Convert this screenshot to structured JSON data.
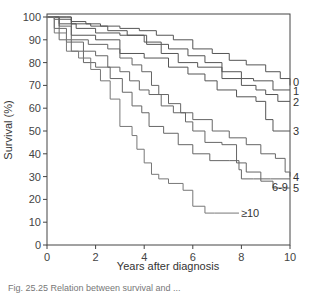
{
  "chart_data": {
    "type": "line",
    "subtype": "kaplan-meier-step",
    "title": "",
    "xlabel": "Years after diagnosis",
    "ylabel": "Survival (%)",
    "xlim": [
      0,
      10
    ],
    "ylim": [
      0,
      100
    ],
    "xticks": [
      0,
      2,
      4,
      6,
      8,
      10
    ],
    "yticks": [
      0,
      10,
      20,
      30,
      40,
      50,
      60,
      70,
      80,
      90,
      100
    ],
    "grid": false,
    "legend": "inline labels at right end of curves",
    "series": [
      {
        "name": "0",
        "label": "0",
        "points": [
          [
            0,
            100
          ],
          [
            0.8,
            100
          ],
          [
            1.0,
            98
          ],
          [
            1.6,
            97
          ],
          [
            2.2,
            96
          ],
          [
            3.0,
            95
          ],
          [
            3.8,
            94
          ],
          [
            4.5,
            92
          ],
          [
            5.2,
            90
          ],
          [
            6.0,
            86
          ],
          [
            6.8,
            84
          ],
          [
            7.5,
            81
          ],
          [
            8.2,
            79
          ],
          [
            9.0,
            76
          ],
          [
            9.6,
            73
          ],
          [
            10,
            70
          ]
        ]
      },
      {
        "name": "1",
        "label": "1",
        "points": [
          [
            0,
            100
          ],
          [
            0.3,
            99
          ],
          [
            1.0,
            97
          ],
          [
            1.8,
            96
          ],
          [
            2.5,
            94
          ],
          [
            3.3,
            92
          ],
          [
            4.1,
            88
          ],
          [
            5.0,
            86
          ],
          [
            5.8,
            83
          ],
          [
            6.5,
            80
          ],
          [
            7.2,
            76
          ],
          [
            8.0,
            73
          ],
          [
            8.5,
            72
          ],
          [
            9.3,
            68
          ],
          [
            10,
            68
          ]
        ]
      },
      {
        "name": "2",
        "label": "2",
        "points": [
          [
            0,
            100
          ],
          [
            0.5,
            97
          ],
          [
            1.2,
            95
          ],
          [
            2.0,
            93
          ],
          [
            3.0,
            92
          ],
          [
            4.0,
            89
          ],
          [
            4.7,
            84
          ],
          [
            5.4,
            80
          ],
          [
            6.2,
            78
          ],
          [
            7.2,
            73
          ],
          [
            8.0,
            70
          ],
          [
            8.6,
            68
          ],
          [
            9.0,
            66
          ],
          [
            9.5,
            63
          ],
          [
            10,
            63
          ]
        ]
      },
      {
        "name": "3",
        "label": "3",
        "points": [
          [
            0,
            100
          ],
          [
            1.0,
            92
          ],
          [
            2.0,
            90
          ],
          [
            3.0,
            84
          ],
          [
            4.0,
            82
          ],
          [
            5.0,
            78
          ],
          [
            5.8,
            75
          ],
          [
            6.5,
            72
          ],
          [
            7.0,
            68
          ],
          [
            7.8,
            65
          ],
          [
            8.6,
            63
          ],
          [
            9.0,
            55
          ],
          [
            9.3,
            50
          ],
          [
            10,
            50
          ]
        ]
      },
      {
        "name": "4",
        "label": "4",
        "points": [
          [
            0,
            100
          ],
          [
            0.5,
            96
          ],
          [
            1.0,
            90
          ],
          [
            1.7,
            88
          ],
          [
            2.5,
            86
          ],
          [
            3.0,
            82
          ],
          [
            3.5,
            79
          ],
          [
            3.9,
            76
          ],
          [
            4.3,
            70
          ],
          [
            4.6,
            66
          ],
          [
            5.0,
            62
          ],
          [
            5.5,
            58
          ],
          [
            6.0,
            55
          ],
          [
            6.8,
            50
          ],
          [
            7.5,
            47
          ],
          [
            8.2,
            44
          ],
          [
            8.8,
            40
          ],
          [
            9.4,
            38
          ],
          [
            9.8,
            32
          ],
          [
            10,
            30
          ]
        ]
      },
      {
        "name": "5",
        "label": "5",
        "points": [
          [
            0,
            100
          ],
          [
            0.3,
            95
          ],
          [
            0.8,
            89
          ],
          [
            1.5,
            85
          ],
          [
            2.0,
            83
          ],
          [
            2.5,
            78
          ],
          [
            3.0,
            76
          ],
          [
            3.4,
            72
          ],
          [
            3.8,
            68
          ],
          [
            4.2,
            66
          ],
          [
            4.7,
            61
          ],
          [
            5.2,
            58
          ],
          [
            5.7,
            54
          ],
          [
            6.0,
            50
          ],
          [
            6.5,
            45
          ],
          [
            7.2,
            44
          ],
          [
            7.8,
            36
          ],
          [
            8.2,
            32
          ],
          [
            8.8,
            28
          ],
          [
            9.3,
            25
          ],
          [
            10,
            25
          ]
        ]
      },
      {
        "name": "6-9",
        "label": "6-9",
        "points": [
          [
            0,
            100
          ],
          [
            0.5,
            90
          ],
          [
            1.0,
            85
          ],
          [
            1.5,
            80
          ],
          [
            2.0,
            78
          ],
          [
            2.6,
            73
          ],
          [
            3.1,
            67
          ],
          [
            3.5,
            61
          ],
          [
            3.9,
            58
          ],
          [
            4.2,
            52
          ],
          [
            4.8,
            49
          ],
          [
            5.4,
            44
          ],
          [
            6.0,
            40
          ],
          [
            6.7,
            37
          ],
          [
            7.5,
            37
          ],
          [
            7.9,
            33
          ],
          [
            8.0,
            29
          ],
          [
            8.5,
            29
          ],
          [
            9.2,
            29
          ],
          [
            10,
            29
          ]
        ]
      },
      {
        "name": ">=10",
        "label": "≥10",
        "points": [
          [
            0,
            100
          ],
          [
            0.3,
            93
          ],
          [
            0.8,
            85
          ],
          [
            1.3,
            82
          ],
          [
            1.8,
            77
          ],
          [
            2.2,
            72
          ],
          [
            2.6,
            64
          ],
          [
            3.0,
            52
          ],
          [
            3.5,
            48
          ],
          [
            3.7,
            42
          ],
          [
            4.0,
            36
          ],
          [
            4.3,
            31
          ],
          [
            4.6,
            29
          ],
          [
            5.0,
            27
          ],
          [
            5.6,
            24
          ],
          [
            6.0,
            17
          ],
          [
            6.5,
            14
          ],
          [
            6.9,
            14
          ],
          [
            7.9,
            14
          ]
        ]
      }
    ],
    "series_colors": {
      "0": "#555555",
      "1": "#555555",
      "2": "#555555",
      "3": "#555555",
      "4": "#666666",
      "5": "#666666",
      "6-9": "#666666",
      ">=10": "#777777"
    }
  },
  "axes": {
    "ylabel": "Survival (%)",
    "xlabel": "Years after diagnosis"
  },
  "caption": "Fig. 25.25   Relation between survival and ..."
}
